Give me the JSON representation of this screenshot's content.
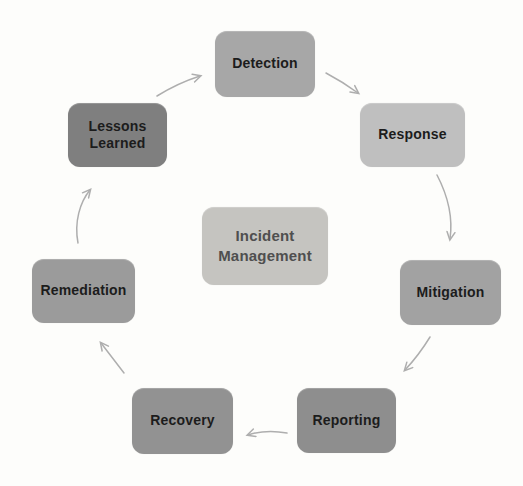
{
  "page": {
    "background_color": "#fdfdfb"
  },
  "diagram": {
    "type": "cycle",
    "center": {
      "label": "Incident Management",
      "color": "#c5c4c0",
      "text_color": "#4f4f4f"
    },
    "nodes": [
      {
        "id": "detection",
        "label": "Detection",
        "color": "#a7a7a7"
      },
      {
        "id": "response",
        "label": "Response",
        "color": "#bfbfbf"
      },
      {
        "id": "mitigation",
        "label": "Mitigation",
        "color": "#a2a2a2"
      },
      {
        "id": "reporting",
        "label": "Reporting",
        "color": "#8e8e8e"
      },
      {
        "id": "recovery",
        "label": "Recovery",
        "color": "#929292"
      },
      {
        "id": "remediation",
        "label": "Remediation",
        "color": "#9b9b9b"
      },
      {
        "id": "lessons-learned",
        "label": "Lessons Learned",
        "color": "#7f7f7f"
      }
    ],
    "node_text_color": "#1c1c1c",
    "arrow_color": "#aeaeae",
    "flow": [
      "Detection",
      "Response",
      "Mitigation",
      "Reporting",
      "Recovery",
      "Remediation",
      "Lessons Learned",
      "Detection"
    ]
  }
}
